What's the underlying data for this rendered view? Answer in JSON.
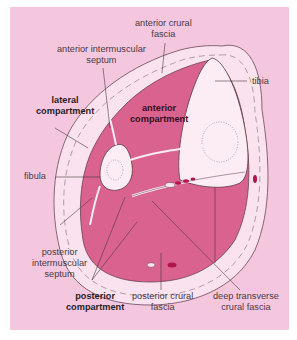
{
  "diagram": {
    "colors": {
      "background": "#f4c7df",
      "muscle": "#d9628e",
      "outer_ring": "#fae3ee",
      "bone": "#fcedf4",
      "vessel": "#b0164a",
      "lines": "#5a3848"
    },
    "labels": {
      "anterior_crural_fascia": [
        "anterior crural",
        "fascia"
      ],
      "anterior_intermuscular_septum": [
        "anterior intermuscular",
        "septum"
      ],
      "tibia": "tibia",
      "lateral_compartment": [
        "lateral",
        "compartment"
      ],
      "anterior_compartment": [
        "anterior",
        "compartment"
      ],
      "fibula": "fibula",
      "posterior_intermuscular_septum": [
        "posterior",
        "intermuscular",
        "septum"
      ],
      "posterior_compartment": [
        "posterior",
        "compartment"
      ],
      "posterior_crural_fascia": [
        "posterior crural",
        "fascia"
      ],
      "deep_transverse_crural_fascia": [
        "deep transverse",
        "crural fascia"
      ]
    }
  }
}
